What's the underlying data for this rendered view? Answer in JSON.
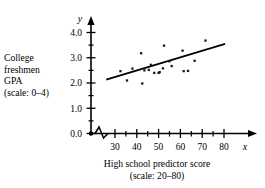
{
  "figure": {
    "title": "",
    "y_caption_lines": [
      "College",
      "freshmen",
      "GPA",
      "(scale: 0–4)"
    ],
    "x_caption_lines": [
      "High school predictor score",
      "(scale: 20–80)"
    ],
    "x_axis_symbol": "x",
    "y_axis_symbol": "y",
    "axis_break_note": "zigzag break on x-axis between origin and 30"
  },
  "chart_data": {
    "type": "scatter",
    "title": "",
    "xlabel": "High school predictor score (scale: 20–80)",
    "ylabel": "College freshmen GPA (scale: 0–4)",
    "xlim": [
      20,
      84
    ],
    "ylim": [
      0.0,
      4.3
    ],
    "xticks": [
      30,
      40,
      50,
      60,
      70,
      80
    ],
    "xtick_labels": [
      "30",
      "40",
      "50",
      "60",
      "70",
      "80"
    ],
    "x_minor_ticks": [
      35,
      45,
      55,
      65,
      75
    ],
    "yticks": [
      0.0,
      1.0,
      2.0,
      3.0,
      4.0
    ],
    "ytick_labels": [
      "0.0",
      "1.0",
      "2.0",
      "3.0",
      "4.0"
    ],
    "y_minor_ticks": [
      0.5,
      1.5,
      2.5,
      3.5
    ],
    "grid": false,
    "legend": null,
    "axis_break": {
      "axis": "x",
      "between": [
        20,
        27
      ]
    },
    "points": [
      {
        "x": 32.5,
        "y": 2.47
      },
      {
        "x": 35.5,
        "y": 2.1
      },
      {
        "x": 38.0,
        "y": 2.57
      },
      {
        "x": 42.0,
        "y": 3.18
      },
      {
        "x": 42.5,
        "y": 1.98
      },
      {
        "x": 43.5,
        "y": 2.5
      },
      {
        "x": 45.5,
        "y": 2.52
      },
      {
        "x": 46.5,
        "y": 2.72
      },
      {
        "x": 48.0,
        "y": 2.4
      },
      {
        "x": 50.0,
        "y": 2.4
      },
      {
        "x": 50.5,
        "y": 2.43
      },
      {
        "x": 52.0,
        "y": 2.58
      },
      {
        "x": 52.5,
        "y": 3.48
      },
      {
        "x": 55.0,
        "y": 2.86
      },
      {
        "x": 56.0,
        "y": 2.67
      },
      {
        "x": 61.0,
        "y": 3.28
      },
      {
        "x": 61.5,
        "y": 2.47
      },
      {
        "x": 63.5,
        "y": 2.48
      },
      {
        "x": 66.5,
        "y": 2.88
      },
      {
        "x": 71.5,
        "y": 3.68
      }
    ],
    "trend_line": {
      "type": "least-squares-fit",
      "x_start": 26.0,
      "y_start": 2.13,
      "x_end": 80.5,
      "y_end": 3.55
    },
    "colors": {
      "axis": "#000000",
      "point": "#1a1a1a",
      "line": "#000000",
      "background": "#ffffff"
    }
  }
}
